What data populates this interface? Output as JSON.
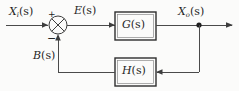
{
  "diagram": {
    "background_color": "#fbfbfa",
    "line_color": "#4a4a4a",
    "text_color": "#1f1f1f",
    "signals": {
      "input": {
        "base": "X",
        "subscript": "i",
        "arg": "(s)"
      },
      "error": {
        "base": "E",
        "subscript": "",
        "arg": "(s)"
      },
      "output": {
        "base": "X",
        "subscript": "o",
        "arg": "(s)"
      },
      "feedback": {
        "base": "B",
        "subscript": "",
        "arg": "(s)"
      }
    },
    "blocks": {
      "forward": {
        "base": "G",
        "arg": "(s)"
      },
      "feedback": {
        "base": "H",
        "arg": "(s)"
      }
    },
    "summing_junction": {
      "plus_sign": "+",
      "minus_sign": "−",
      "style": "circle-with-cross"
    }
  }
}
